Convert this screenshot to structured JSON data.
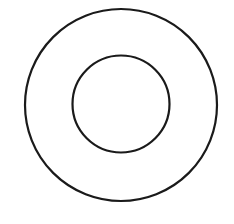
{
  "diagram": {
    "type": "concentric-circles",
    "background": "#ffffff",
    "stroke_color": "#1a1a1a",
    "stroke_width": 2.2,
    "circles": [
      {
        "name": "outer",
        "cx": 121,
        "cy": 105,
        "r": 96
      },
      {
        "name": "inner",
        "cx": 121,
        "cy": 104,
        "r": 48.5
      }
    ]
  }
}
